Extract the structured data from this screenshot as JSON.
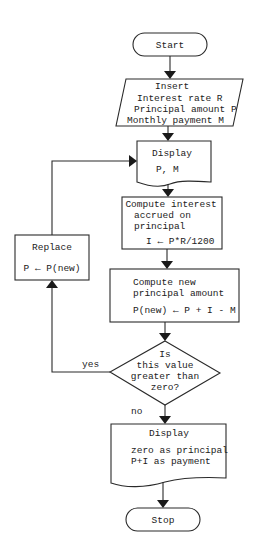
{
  "flowchart": {
    "start": {
      "label": "Start"
    },
    "input": {
      "title": "Insert",
      "lines": [
        "Interest rate R",
        "Principal amount P",
        "Monthly payment M"
      ]
    },
    "display1": {
      "title": "Display",
      "lines": [
        "P, M"
      ]
    },
    "compute_interest": {
      "lines": [
        "Compute interest",
        "accrued on",
        "principal",
        "I ← P*R/1200"
      ]
    },
    "compute_principal": {
      "lines": [
        "Compute new",
        "principal amount",
        "P(new) ← P + I - M"
      ]
    },
    "decision": {
      "lines": [
        "Is",
        "this value",
        "greater than",
        "zero?"
      ],
      "yes_label": "yes",
      "no_label": "no"
    },
    "replace": {
      "title": "Replace",
      "lines": [
        "P ← P(new)"
      ]
    },
    "display2": {
      "title": "Display",
      "lines": [
        "zero as principal",
        "P+I as payment"
      ]
    },
    "stop": {
      "label": "Stop"
    }
  }
}
